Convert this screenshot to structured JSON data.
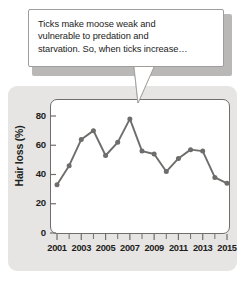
{
  "callout": {
    "text": "Ticks make moose weak and vulnerable to predation and starvation. So, when ticks increase…",
    "lines": [
      "Ticks make moose weak and",
      "vulnerable to predation and",
      "starvation. So, when ticks increase…"
    ],
    "tail_direction": "down-left"
  },
  "colors": {
    "line": "#6e6d6b",
    "marker": "#6e6d6b",
    "axis": "#6f6e6c",
    "text": "#1d1d1b",
    "card_background": "#e6e5e3",
    "plot_background": "#ffffff",
    "callout_shadow": "#b9b8b6"
  },
  "chart_data": {
    "type": "line",
    "title": "",
    "xlabel": "",
    "ylabel": "Hair loss (%)",
    "x": [
      2001,
      2002,
      2003,
      2004,
      2005,
      2006,
      2007,
      2008,
      2009,
      2010,
      2011,
      2012,
      2013,
      2014,
      2015
    ],
    "values": [
      33,
      46,
      64,
      70,
      53,
      62,
      78,
      56,
      54,
      42,
      51,
      57,
      56,
      38,
      34
    ],
    "xlim": [
      2001,
      2015
    ],
    "ylim": [
      0,
      88
    ],
    "ytick_labels": [
      "0",
      "20",
      "40",
      "60",
      "80"
    ],
    "yticks": [
      0,
      20,
      40,
      60,
      80
    ],
    "xtick_labels": [
      "2001",
      "2003",
      "2005",
      "2007",
      "2009",
      "2011",
      "2013",
      "2015"
    ],
    "xticks_major": [
      2001,
      2003,
      2005,
      2007,
      2009,
      2011,
      2013,
      2015
    ],
    "xticks_minor": [
      2002,
      2004,
      2006,
      2008,
      2010,
      2012,
      2014
    ],
    "grid": false,
    "legend": null,
    "markers": true
  }
}
